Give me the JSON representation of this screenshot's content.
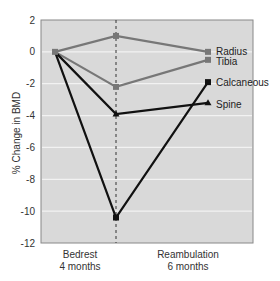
{
  "chart_data": {
    "type": "line",
    "title": "",
    "xlabel": "",
    "ylabel": "% Change in BMD",
    "ylim": [
      -12,
      2
    ],
    "yticks": [
      2,
      0,
      -2,
      -4,
      -6,
      -8,
      -10,
      -12
    ],
    "x": [
      "Baseline",
      "Bedrest 4 months",
      "Reambulation 6 months"
    ],
    "x_tick_labels": [
      {
        "line1": "Bedrest",
        "line2": "4 months"
      },
      {
        "line1": "Reambulation",
        "line2": "6 months"
      }
    ],
    "grid": true,
    "legend_position": "inline-right",
    "series": [
      {
        "name": "Radius",
        "values": [
          0,
          1.0,
          0
        ],
        "color": "#777777",
        "marker": "square"
      },
      {
        "name": "Tibia",
        "values": [
          0,
          -2.2,
          -0.5
        ],
        "color": "#777777",
        "marker": "square"
      },
      {
        "name": "Calcaneous",
        "values": [
          0,
          -10.4,
          -1.9
        ],
        "color": "#111111",
        "marker": "square"
      },
      {
        "name": "Spine",
        "values": [
          0,
          -3.9,
          -3.2
        ],
        "color": "#111111",
        "marker": "triangle"
      }
    ],
    "annotations": [
      {
        "type": "vertical-dashed-line",
        "at": "Bedrest 4 months"
      }
    ]
  },
  "colors": {
    "plot_bg": "#d9d9d9",
    "grid": "#f2f2f2",
    "frame": "#888888"
  }
}
